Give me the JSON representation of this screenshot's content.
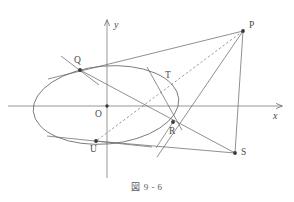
{
  "figure": {
    "caption": "図 9 - 6",
    "type": "euclidean-geometry-diagram"
  },
  "axes": {
    "x_label": "x",
    "y_label": "y",
    "origin_label": "O",
    "x_axis": {
      "x1": 8,
      "y1": 106,
      "x2": 282,
      "y2": 106
    },
    "y_axis": {
      "x1": 107,
      "y1": 178,
      "x2": 107,
      "y2": 20
    },
    "x_label_pos": {
      "x": 273,
      "y": 112
    },
    "y_label_pos": {
      "x": 114,
      "y": 20
    },
    "origin_label_pos": {
      "x": 96,
      "y": 111
    }
  },
  "conic": {
    "name": "ellipse",
    "cx": 106,
    "cy": 105,
    "rx": 73,
    "ry": 39,
    "rotation_deg": -5
  },
  "points": [
    {
      "id": "P",
      "label": "P",
      "x": 243,
      "y": 31,
      "label_x": 249,
      "label_y": 25,
      "dot": true
    },
    {
      "id": "Q",
      "label": "Q",
      "x": 80,
      "y": 70,
      "label_x": 75,
      "label_y": 58,
      "dot": true
    },
    {
      "id": "T",
      "label": "T",
      "x": 163,
      "y": 84,
      "label_x": 166,
      "label_y": 73,
      "dot": false
    },
    {
      "id": "R",
      "label": "R",
      "x": 173,
      "y": 122,
      "label_x": 170,
      "label_y": 128,
      "dot": true
    },
    {
      "id": "S",
      "label": "S",
      "x": 235,
      "y": 153,
      "label_x": 241,
      "label_y": 150,
      "dot": true
    },
    {
      "id": "U",
      "label": "U",
      "x": 96,
      "y": 141,
      "label_x": 91,
      "label_y": 146,
      "dot": true
    },
    {
      "id": "O",
      "label": "O",
      "x": 107,
      "y": 106,
      "label_x": 96,
      "label_y": 111,
      "dot": true
    }
  ],
  "segments": [
    {
      "id": "line-PQ-extended",
      "from": "P",
      "to": "Q-extended",
      "x1": 243,
      "y1": 31,
      "x2": 48,
      "y2": 79,
      "style": "solid"
    },
    {
      "id": "line-P-S",
      "from": "P",
      "to": "S",
      "x1": 243,
      "y1": 31,
      "x2": 235,
      "y2": 153,
      "style": "solid"
    },
    {
      "id": "line-P-U-dashed",
      "from": "P",
      "to": "U",
      "x1": 243,
      "y1": 31,
      "x2": 96,
      "y2": 141,
      "style": "dashed"
    },
    {
      "id": "line-P-R",
      "from": "P",
      "to": "R-extended",
      "x1": 243,
      "y1": 31,
      "x2": 157,
      "y2": 155,
      "style": "solid"
    },
    {
      "id": "line-Q-S",
      "from": "Q",
      "to": "S",
      "x1": 80,
      "y1": 70,
      "x2": 235,
      "y2": 153,
      "style": "solid"
    },
    {
      "id": "line-U-S",
      "from": "U",
      "to": "S",
      "x1": 96,
      "y1": 141,
      "x2": 235,
      "y2": 153,
      "style": "solid"
    },
    {
      "id": "tangent-at-Q",
      "from": "Q-tangent-a",
      "to": "Q-tangent-b",
      "x1": 62,
      "y1": 57,
      "x2": 98,
      "y2": 84,
      "style": "solid"
    },
    {
      "id": "tangent-at-U",
      "from": "U-tangent-a",
      "to": "U-tangent-b",
      "x1": 48,
      "y1": 137,
      "x2": 150,
      "y2": 146,
      "style": "solid"
    },
    {
      "id": "tangent-at-T",
      "from": "T-tangent-a",
      "to": "T-tangent-b",
      "x1": 148,
      "y1": 68,
      "x2": 180,
      "y2": 126,
      "style": "solid"
    },
    {
      "id": "segment-R-foot",
      "from": "R",
      "to": "foot",
      "x1": 173,
      "y1": 122,
      "x2": 155,
      "y2": 148,
      "style": "solid"
    }
  ],
  "colors": {
    "stroke": "#6b6b6b",
    "axis": "#6b6b6b",
    "point": "#3a3a3a",
    "text": "#4a4a4a",
    "background": "#ffffff"
  }
}
